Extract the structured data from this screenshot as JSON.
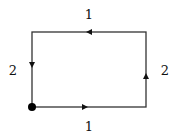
{
  "diagram": {
    "type": "rectangular loop path",
    "edges": [
      {
        "side": "top",
        "label": "1",
        "direction": "right-to-left"
      },
      {
        "side": "left",
        "label": "2",
        "direction": "top-to-bottom"
      },
      {
        "side": "bottom",
        "label": "1",
        "direction": "left-to-right"
      },
      {
        "side": "right",
        "label": "2",
        "direction": "bottom-to-top"
      }
    ],
    "start_point": "bottom-left",
    "colors": {
      "stroke": "#333333",
      "fill": "#000000"
    }
  }
}
